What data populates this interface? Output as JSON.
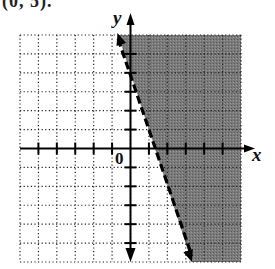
{
  "caption": "(0, 5).",
  "chart_data": {
    "type": "inequality-graph",
    "title": "",
    "xlabel": "x",
    "ylabel": "y",
    "origin_label": "0",
    "xlim": [
      -6,
      6
    ],
    "ylim": [
      -6,
      6
    ],
    "grid": true,
    "grid_style": "dotted",
    "grid_step": 1,
    "boundary_line": {
      "equation": "y = -3x + 4",
      "slope": -3,
      "y_intercept": 4,
      "x_intercept": 1.33,
      "style": "dashed",
      "points": [
        [
          -0.67,
          6
        ],
        [
          3.33,
          -6
        ]
      ]
    },
    "inequality": "y > -3x + 4",
    "shaded_region": "right of / above the dashed line",
    "shade_color": "#6e6e6e"
  }
}
